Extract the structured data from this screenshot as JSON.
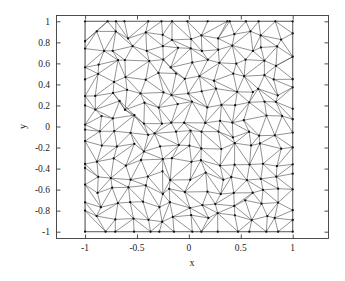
{
  "figure": {
    "background_color": "#ffffff",
    "axes_frame_color": "#3a3a3a",
    "mesh_line_color": "#4a4a4a",
    "mesh_node_color": "#111111",
    "mesh_boundary_color": "#6e6e6e"
  },
  "axes": {
    "box": {
      "left": 56,
      "top": 15,
      "right": 328,
      "bottom": 238
    },
    "tick_direction": "in",
    "box_on": true
  },
  "chart_data": {
    "type": "scatter",
    "title": "",
    "subtitle": "",
    "xlabel": "x",
    "ylabel": "y",
    "xlim": [
      -1.28,
      1.34
    ],
    "ylim": [
      -1.06,
      1.06
    ],
    "grid": false,
    "legend": null,
    "plot_kind": "triangular-mesh",
    "domain": {
      "x": [
        -1,
        1
      ],
      "y": [
        -1,
        1
      ]
    },
    "xticks": [
      -1,
      -0.5,
      0,
      0.5,
      1
    ],
    "xticklabels": [
      "-1",
      "-0.5",
      "0",
      "0.5",
      "1"
    ],
    "yticks": [
      1,
      0.8,
      0.6,
      0.4,
      0.2,
      0,
      -0.2,
      -0.4,
      -0.6,
      -0.8,
      -1
    ],
    "yticklabels": [
      "1",
      "0.8",
      "0.6",
      "0.4",
      "0.2",
      "0",
      "-0.2",
      "-0.4",
      "-0.6",
      "-0.8",
      "-1"
    ],
    "mesh": {
      "n_divisions_x": 14,
      "n_divisions_y": 15,
      "jitter": 0.33,
      "seed": 20240517,
      "node_marker": "dot",
      "node_radius_px": 1.15,
      "edge_width_px": 0.6
    }
  }
}
